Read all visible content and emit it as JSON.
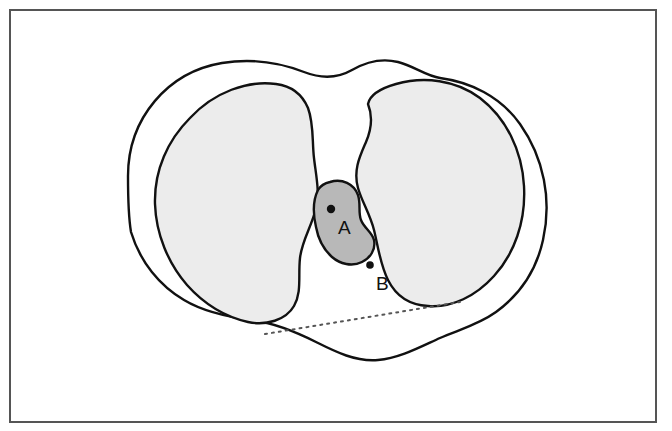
{
  "figure": {
    "frame": {
      "border_color": "#555555",
      "background_color": "#ffffff"
    },
    "colors": {
      "outline": "#111111",
      "lobe_fill": "#ececec",
      "central_fill": "#b8b8b8",
      "marker_fill": "#111111",
      "dotted_line": "#555555"
    },
    "regions": [
      {
        "id": "left-lobe",
        "name": "left-lobe",
        "fill": "#ececec",
        "description": "Large shaded lobe, left side"
      },
      {
        "id": "right-lobe",
        "name": "right-lobe",
        "fill": "#ececec",
        "description": "Large shaded lobe, right side"
      },
      {
        "id": "central-structure",
        "name": "central-structure",
        "fill": "#b8b8b8",
        "description": "Small darker shaded structure between the lobes"
      }
    ],
    "markers": [
      {
        "id": "A",
        "label": "A",
        "point": {
          "x": 331,
          "y": 209
        },
        "label_pos": {
          "x": 338,
          "y": 234
        },
        "location": "inside central structure"
      },
      {
        "id": "B",
        "label": "B",
        "point": {
          "x": 370,
          "y": 265
        },
        "label_pos": {
          "x": 376,
          "y": 290
        },
        "location": "below and right of central structure"
      }
    ]
  }
}
